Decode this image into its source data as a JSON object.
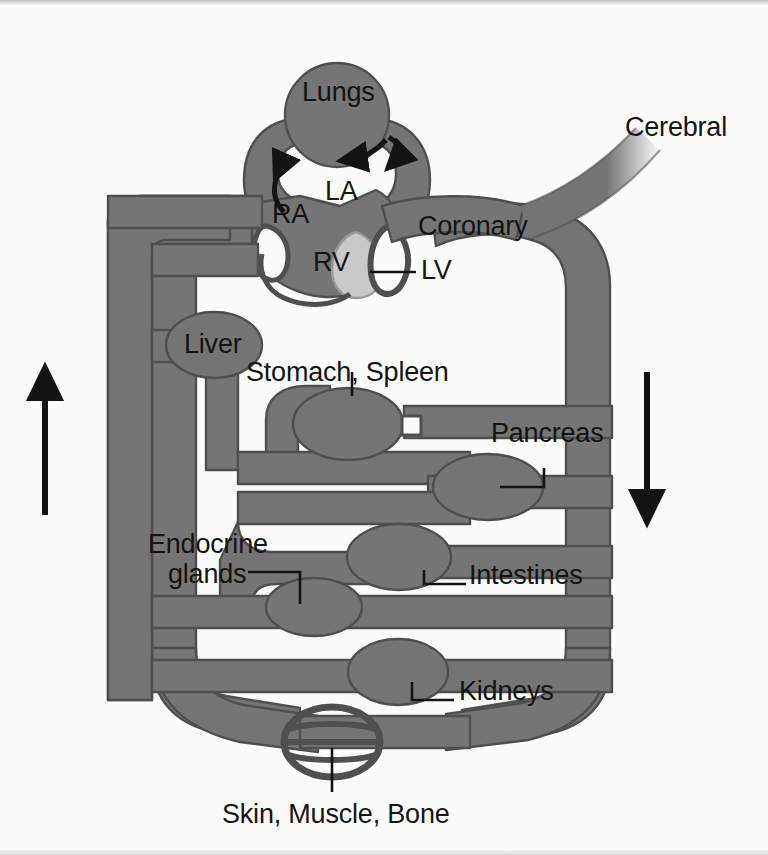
{
  "figure": {
    "type": "anatomical-flow-diagram",
    "colors": {
      "vessel_fill": "#757575",
      "vessel_stroke": "#4f4f4f",
      "ventricle_light": "#c9c9c9",
      "background": "#fbfbfa",
      "text": "#141414",
      "arrow": "#141414"
    }
  },
  "labels": {
    "lungs": "Lungs",
    "cerebral": "Cerebral",
    "la": "LA",
    "ra": "RA",
    "rv": "RV",
    "lv": "LV",
    "coronary": "Coronary",
    "liver": "Liver",
    "stomach_spleen": "Stomach, Spleen",
    "pancreas": "Pancreas",
    "endocrine_line1": "Endocrine",
    "endocrine_line2": "glands",
    "intestines": "Intestines",
    "kidneys": "Kidneys",
    "skin_muscle_bone": "Skin, Muscle, Bone"
  },
  "flow_arrows": [
    {
      "name": "venous-return-upward",
      "direction": "up",
      "side": "left"
    },
    {
      "name": "arterial-outflow-downward",
      "direction": "down",
      "side": "right"
    },
    {
      "name": "pulmonary-artery-flow",
      "direction": "counterclockwise",
      "side": "lungs-left"
    },
    {
      "name": "pulmonary-vein-flow",
      "direction": "leftward",
      "side": "lungs-right"
    }
  ],
  "organ_beds": [
    "Lungs",
    "Cerebral",
    "Coronary",
    "Liver",
    "Stomach, Spleen",
    "Pancreas",
    "Endocrine glands",
    "Intestines",
    "Kidneys",
    "Skin, Muscle, Bone"
  ],
  "heart_chambers": [
    "RA",
    "RV",
    "LA",
    "LV"
  ]
}
